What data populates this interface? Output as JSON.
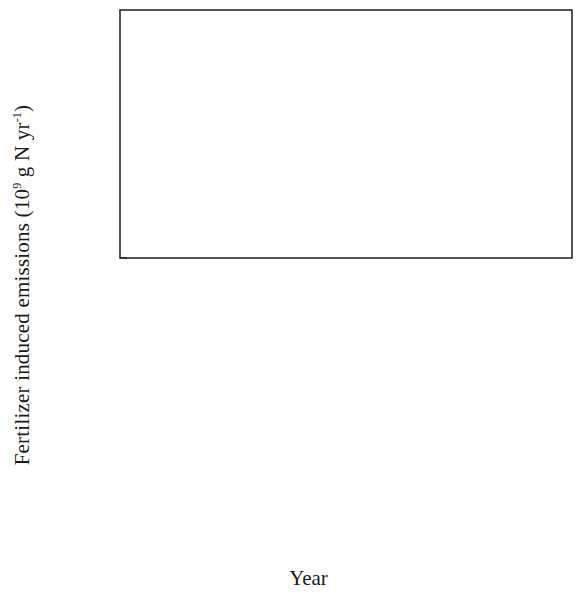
{
  "axis": {
    "ylabel_text": "Fertilizer induced emissions (10",
    "ylabel_sup": "9",
    "ylabel_tail": " g N yr",
    "ylabel_sup2": "-1",
    "ylabel_close": ")",
    "xlabel": "Year",
    "panel_a_tag": "(a)",
    "panel_b_tag": "(b)"
  },
  "legend": {
    "items": [
      {
        "label": "Urea",
        "marker": "circle",
        "color": "#111111"
      },
      {
        "label": "AN",
        "marker": "circle",
        "color": "#ec6a42"
      },
      {
        "label": "ABC",
        "marker": "triangle-down",
        "color": "#8cc63e"
      },
      {
        "label": "Overall",
        "marker": "triangle-up",
        "color": "#eded2e"
      }
    ]
  },
  "colors": {
    "urea": "#111111",
    "an": "#ec6a42",
    "abc": "#8cc63e",
    "overall": "#eded2e",
    "dashed": "#7b7fc4",
    "line": "#3c3c3c",
    "axis": "#2b2b2b"
  },
  "chart_data": [
    {
      "type": "line",
      "panel": "(a)",
      "title": "",
      "xlabel": "Year",
      "ylabel": "Fertilizer induced emissions (10^9 g N yr^-1)",
      "xlim": [
        1979,
        2004
      ],
      "ylim": [
        0,
        800
      ],
      "xticks": [
        1980,
        1985,
        1990,
        1995,
        2000
      ],
      "yticks": [
        0,
        200,
        400,
        600,
        800
      ],
      "grid": false,
      "legend_position": "top-center",
      "x": [
        1980,
        1981,
        1982,
        1983,
        1984,
        1985,
        1986,
        1987,
        1988,
        1989,
        1990,
        1991,
        1992,
        1993,
        1994,
        1995,
        1996,
        1997,
        1998,
        1999,
        2000,
        2001,
        2002,
        2003
      ],
      "series": [
        {
          "name": "Urea",
          "marker": "circle",
          "color": "#111111",
          "values": [
            113,
            110,
            112,
            130,
            143,
            148,
            150,
            152,
            163,
            178,
            205,
            212,
            216,
            243,
            205,
            207,
            290,
            295,
            305,
            300,
            312,
            332,
            333,
            382
          ]
        },
        {
          "name": "AN",
          "marker": "circle",
          "color": "#ec6a42",
          "values": [
            18,
            17,
            17,
            17,
            16,
            16,
            15,
            15,
            15,
            14,
            14,
            13,
            13,
            13,
            12,
            12,
            12,
            11,
            11,
            11,
            10,
            10,
            10,
            10
          ]
        },
        {
          "name": "ABC",
          "marker": "triangle-down",
          "color": "#8cc63e",
          "values": [
            148,
            143,
            150,
            152,
            150,
            160,
            180,
            172,
            172,
            168,
            195,
            213,
            188,
            193,
            190,
            192,
            218,
            197,
            190,
            178,
            145,
            140,
            143,
            145
          ]
        },
        {
          "name": "Overall",
          "marker": "triangle-up",
          "color": "#eded2e",
          "has_error_bars": true,
          "values": [
            280,
            266,
            281,
            300,
            347,
            310,
            305,
            392,
            432,
            440,
            452,
            455,
            448,
            410,
            437,
            540,
            575,
            517,
            512,
            505,
            510,
            490,
            545,
            560
          ]
        },
        {
          "name": "dashed-reference",
          "marker": "none",
          "color": "#7b7fc4",
          "style": "dashed",
          "values": [
            248,
            240,
            250,
            262,
            300,
            270,
            268,
            345,
            385,
            390,
            400,
            405,
            398,
            365,
            390,
            472,
            495,
            455,
            450,
            445,
            448,
            432,
            478,
            492
          ]
        }
      ]
    },
    {
      "type": "line",
      "panel": "(b)",
      "title": "",
      "xlabel": "Year",
      "ylabel": "Fertilizer induced emissions (10^9 g N yr^-1)",
      "xlim": [
        1979,
        2004
      ],
      "ylim": [
        0,
        2900
      ],
      "xticks": [
        1980,
        1985,
        1990,
        1995,
        2000
      ],
      "yticks": [
        0,
        500,
        1000,
        1500,
        2000,
        2500
      ],
      "grid": false,
      "legend_position": "none",
      "x": [
        1980,
        1981,
        1982,
        1983,
        1984,
        1985,
        1986,
        1987,
        1988,
        1989,
        1990,
        1991,
        1992,
        1993,
        1994,
        1995,
        1996,
        1997,
        1998,
        1999,
        2000,
        2001,
        2002,
        2003
      ],
      "series": [
        {
          "name": "Urea",
          "marker": "circle",
          "color": "#111111",
          "values": [
            480,
            450,
            510,
            600,
            615,
            600,
            700,
            820,
            880,
            915,
            940,
            1000,
            930,
            870,
            880,
            1200,
            1255,
            1215,
            1320,
            1380,
            1380,
            1480,
            1600,
            1605
          ]
        },
        {
          "name": "AN",
          "marker": "circle",
          "color": "#ec6a42",
          "values": [
            40,
            38,
            38,
            37,
            36,
            35,
            34,
            34,
            33,
            32,
            31,
            30,
            30,
            29,
            28,
            27,
            26,
            25,
            25,
            24,
            23,
            22,
            22,
            21
          ]
        },
        {
          "name": "ABC",
          "marker": "triangle-down",
          "color": "#8cc63e",
          "values": [
            960,
            910,
            990,
            1080,
            1190,
            1020,
            1000,
            1240,
            1350,
            1400,
            1400,
            1410,
            1360,
            1290,
            1400,
            1540,
            1280,
            1280,
            1210,
            920,
            890,
            940,
            935,
            940
          ]
        },
        {
          "name": "Overall",
          "marker": "triangle-up",
          "color": "#eded2e",
          "has_error_bars": true,
          "values": [
            1480,
            1390,
            1540,
            1660,
            1840,
            1650,
            1630,
            2040,
            2220,
            2320,
            2320,
            2330,
            2290,
            2200,
            2400,
            2660,
            2810,
            2560,
            2470,
            2360,
            2580,
            2370,
            2620,
            2620
          ]
        },
        {
          "name": "dashed-reference",
          "marker": "none",
          "color": "#7b7fc4",
          "style": "dashed",
          "values": [
            420,
            385,
            430,
            470,
            490,
            480,
            560,
            690,
            760,
            800,
            830,
            870,
            810,
            780,
            790,
            1050,
            1130,
            1090,
            1060,
            1020,
            1010,
            1060,
            1120,
            1125
          ]
        }
      ]
    }
  ]
}
